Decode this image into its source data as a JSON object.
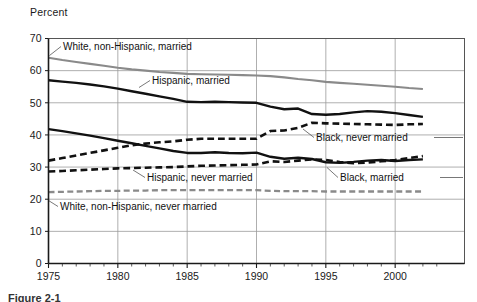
{
  "figure": {
    "ylabel": "Percent",
    "caption_partial": "Figure 2-1"
  },
  "chart_data": {
    "type": "line",
    "title": "",
    "xlabel": "",
    "ylabel": "Percent",
    "xlim": [
      1975,
      2002
    ],
    "ylim": [
      0,
      70
    ],
    "ytick_labels": [
      "0",
      "10",
      "20",
      "30",
      "40",
      "50",
      "60",
      "70"
    ],
    "yticks": [
      0,
      10,
      20,
      30,
      40,
      50,
      60,
      70
    ],
    "xtick_labels": [
      "1975",
      "1980",
      "1985",
      "1990",
      "1995",
      "2000"
    ],
    "xticks": [
      1975,
      1980,
      1985,
      1990,
      1995,
      2000
    ],
    "grid": true,
    "minor_xticks": true,
    "legend": "inline-annotations",
    "x": [
      1975,
      1976,
      1977,
      1978,
      1979,
      1980,
      1981,
      1982,
      1983,
      1984,
      1985,
      1986,
      1987,
      1988,
      1989,
      1990,
      1991,
      1992,
      1993,
      1994,
      1995,
      1996,
      1997,
      1998,
      1999,
      2000,
      2001,
      2002
    ],
    "series": [
      {
        "name": "White, non-Hispanic, married",
        "style": "solid",
        "color": "#8a8a8a",
        "width": 2.1,
        "values": [
          64.0,
          63.3,
          62.7,
          62.1,
          61.5,
          60.9,
          60.4,
          60.0,
          59.6,
          59.3,
          59.0,
          58.9,
          58.8,
          58.7,
          58.6,
          58.5,
          58.3,
          57.9,
          57.4,
          57.0,
          56.5,
          56.2,
          55.9,
          55.6,
          55.3,
          55.0,
          54.6,
          54.3
        ]
      },
      {
        "name": "Hispanic, married",
        "style": "solid",
        "color": "#111111",
        "width": 2.4,
        "values": [
          57.0,
          56.6,
          56.2,
          55.7,
          55.1,
          54.4,
          53.6,
          52.8,
          52.0,
          51.2,
          50.3,
          50.2,
          50.3,
          50.2,
          50.1,
          50.0,
          48.8,
          48.0,
          48.2,
          46.5,
          46.3,
          46.5,
          47.0,
          47.4,
          47.2,
          46.8,
          46.2,
          45.6
        ]
      },
      {
        "name": "Black, married",
        "style": "solid",
        "color": "#111111",
        "width": 2.4,
        "values": [
          41.8,
          41.2,
          40.5,
          39.8,
          39.0,
          38.2,
          37.4,
          36.6,
          35.8,
          35.0,
          34.4,
          34.4,
          34.6,
          34.4,
          34.3,
          34.5,
          33.2,
          32.6,
          32.9,
          32.5,
          31.5,
          31.3,
          31.6,
          32.0,
          32.2,
          31.9,
          32.2,
          32.4
        ]
      },
      {
        "name": "Black, never married",
        "style": "dashed",
        "color": "#111111",
        "width": 2.6,
        "values": [
          32.0,
          32.8,
          33.6,
          34.4,
          35.2,
          36.0,
          36.8,
          37.3,
          37.7,
          38.0,
          38.5,
          38.8,
          38.8,
          38.8,
          38.8,
          38.8,
          41.2,
          41.4,
          42.2,
          43.8,
          43.6,
          43.5,
          43.4,
          43.3,
          43.2,
          43.1,
          43.3,
          43.4
        ]
      },
      {
        "name": "Hispanic, never married",
        "style": "dashed",
        "color": "#111111",
        "width": 2.6,
        "values": [
          28.6,
          28.8,
          29.0,
          29.2,
          29.4,
          29.6,
          29.7,
          29.8,
          29.9,
          30.0,
          30.2,
          30.4,
          30.5,
          30.6,
          30.7,
          30.8,
          31.8,
          31.6,
          32.0,
          32.4,
          32.2,
          31.6,
          31.2,
          31.4,
          31.8,
          32.2,
          32.8,
          33.4
        ]
      },
      {
        "name": "White, non-Hispanic, never married",
        "style": "dashed",
        "color": "#8a8a8a",
        "width": 2.3,
        "values": [
          22.2,
          22.3,
          22.4,
          22.5,
          22.6,
          22.6,
          22.7,
          22.7,
          22.8,
          22.8,
          22.8,
          22.8,
          22.8,
          22.8,
          22.8,
          22.8,
          22.6,
          22.5,
          22.5,
          22.5,
          22.4,
          22.4,
          22.4,
          22.4,
          22.4,
          22.4,
          22.4,
          22.4
        ]
      }
    ],
    "annotations": [
      {
        "id": "ann-white-married",
        "text": "White, non-Hispanic, married",
        "x": 63,
        "y": 50,
        "anchor": "start"
      },
      {
        "id": "ann-hispanic-married",
        "text": "Hispanic, married",
        "x": 152,
        "y": 84,
        "anchor": "start"
      },
      {
        "id": "ann-black-never",
        "text": "Black, never married",
        "x": 316,
        "y": 141,
        "anchor": "start"
      },
      {
        "id": "ann-hispanic-never",
        "text": "Hispanic, never married",
        "x": 147,
        "y": 181,
        "anchor": "start"
      },
      {
        "id": "ann-black-married",
        "text": "Black, married",
        "x": 340,
        "y": 181,
        "anchor": "start"
      },
      {
        "id": "ann-white-never",
        "text": "White, non-Hispanic, never married",
        "x": 60,
        "y": 210,
        "anchor": "start"
      }
    ]
  }
}
